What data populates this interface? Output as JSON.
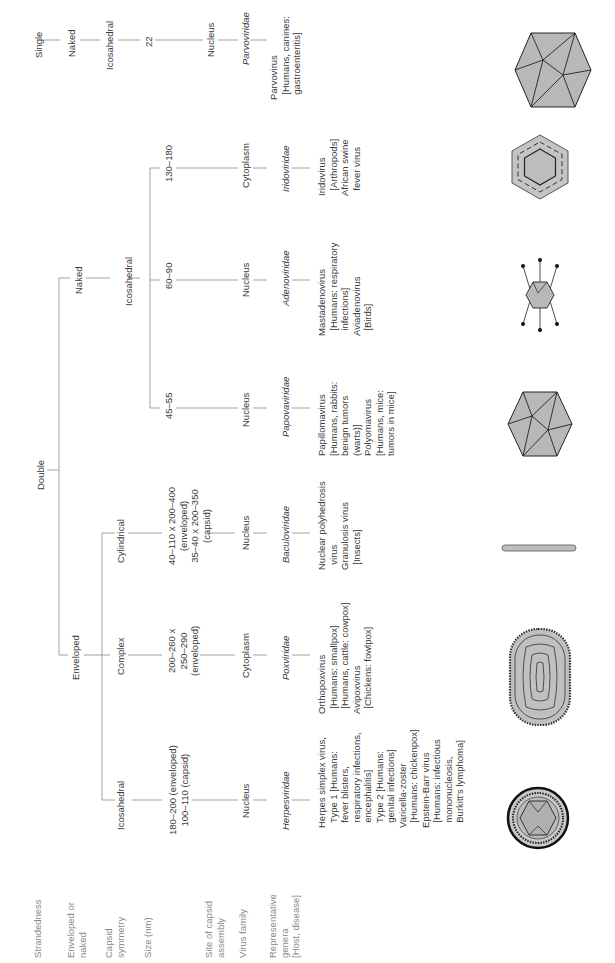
{
  "row_headers": {
    "strandedness": "Strandedness",
    "enveloped_or_naked": "Enveloped or\nnaked",
    "capsid_symmetry": "Capsid\nsymmetry",
    "size": "Size (nm)",
    "site": "Site of capsid\nassembly",
    "family": "Virus family",
    "genera": "Representative\ngenera\n[Host, disease]"
  },
  "strandedness": {
    "single": "Single",
    "double": "Double"
  },
  "envelope": {
    "naked_single": "Naked",
    "naked_double": "Naked",
    "enveloped": "Enveloped"
  },
  "columns": [
    {
      "id": "parvo",
      "strand": "Single",
      "envelope": "Naked",
      "symmetry": "Icosahedral",
      "size": "22",
      "site": "Nucleus",
      "family": "Parvoviridae",
      "genera": "Parvovirus\n  [Humans, canines:\n  gastroenteritis]",
      "shape": "icosahedron-icon"
    },
    {
      "id": "irido",
      "strand": "Double",
      "envelope": "Naked",
      "symmetry": "Icosahedral",
      "size": "130–180",
      "site": "Cytoplasm",
      "family": "Iridoviridae",
      "genera": "Iridovirus\n  [Arthropods]\nAfrican swine\n  fever virus",
      "shape": "hexagon-layered-icon"
    },
    {
      "id": "adeno",
      "strand": "Double",
      "envelope": "Naked",
      "symmetry": "Icosahedral",
      "size": "60–90",
      "site": "Nucleus",
      "family": "Adenoviridae",
      "genera": "Mastadenovirus\n  [Humans: respiratory\n  infections]\nAviadenovirus\n  [Birds]",
      "shape": "icosahedron-fibers-icon"
    },
    {
      "id": "papova",
      "strand": "Double",
      "envelope": "Naked",
      "symmetry": "Icosahedral",
      "size": "45–55",
      "site": "Nucleus",
      "family": "Papovaviridae",
      "genera": "Papillomavirus\n[Humans, rabbits:\nbenign tumors\n(warts)]\nPolyomavirus\n[Humans, mice:\ntumors in mice]",
      "shape": "icosahedron-icon"
    },
    {
      "id": "baculo",
      "strand": "Double",
      "envelope": "Enveloped",
      "symmetry": "Cylindrical",
      "size": "40–110 x 200–400\n(enveloped)\n35–40 x 200–350\n(capsid)",
      "site": "Nucleus",
      "family": "Baculoviridae",
      "genera": "Nuclear polyhedrosis\n  virus\nGranulosis virus\n  [Insects]",
      "shape": "rod-icon"
    },
    {
      "id": "pox",
      "strand": "Double",
      "envelope": "Enveloped",
      "symmetry": "Complex",
      "size": "200–260 x\n250–290\n(enveloped)",
      "site": "Cytoplasm",
      "family": "Poxviridae",
      "genera": "Orthopoxvirus\n  [Humans: smallpox]\n  [Humans, cattle: cowpox]\nAvipoxvirus\n  [Chickens: fowlpox]",
      "shape": "brick-icon"
    },
    {
      "id": "herpes",
      "strand": "Double",
      "envelope": "Enveloped",
      "symmetry": "Icosahedral",
      "size": "180–200 (enveloped)\n100–110 (capsid)",
      "site": "Nucleus",
      "family": "Herpesviridae",
      "genera": "Herpes simplex virus,\n  Type 1 [Humans:\n  fever blisters,\n  respiratory infections,\n  encephalitis]\n  Type 2 [Humans:\n  genital infections]\nVaricella-zoster\n  [Humans: chickenpox]\nEpstein-Barr virus\n  [Humans: infectious\n  mononucleosis,\n  Burkitt's lymphoma]",
      "shape": "enveloped-icosahedron-icon"
    }
  ],
  "naked_double_symmetry": "Icosahedral",
  "colors": {
    "line": "#8c8c8c",
    "text": "#3a3a3a",
    "header": "#8a8a8a",
    "shape_fill": "#b8b8b8",
    "shape_stroke": "#222222"
  }
}
